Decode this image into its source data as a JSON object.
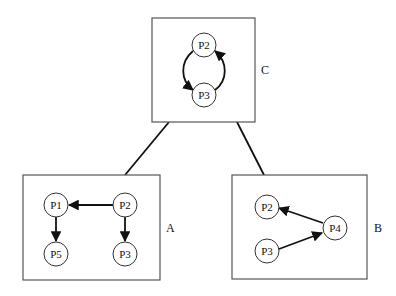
{
  "diagram": {
    "boxes": [
      {
        "id": "C",
        "label": "C",
        "nodes": [
          {
            "id": "P2",
            "label": "P2"
          },
          {
            "id": "P3",
            "label": "P3"
          }
        ],
        "edges": [
          [
            "P2",
            "P3"
          ],
          [
            "P3",
            "P2"
          ]
        ]
      },
      {
        "id": "A",
        "label": "A",
        "nodes": [
          {
            "id": "P1",
            "label": "P1"
          },
          {
            "id": "P2",
            "label": "P2"
          },
          {
            "id": "P5",
            "label": "P5"
          },
          {
            "id": "P3",
            "label": "P3"
          }
        ],
        "edges": [
          [
            "P2",
            "P1"
          ],
          [
            "P1",
            "P5"
          ],
          [
            "P2",
            "P3"
          ]
        ]
      },
      {
        "id": "B",
        "label": "B",
        "nodes": [
          {
            "id": "P2",
            "label": "P2"
          },
          {
            "id": "P3",
            "label": "P3"
          },
          {
            "id": "P4",
            "label": "P4"
          }
        ],
        "edges": [
          [
            "P4",
            "P2"
          ],
          [
            "P3",
            "P4"
          ]
        ]
      }
    ],
    "links": [
      [
        "C",
        "A"
      ],
      [
        "C",
        "B"
      ]
    ]
  }
}
